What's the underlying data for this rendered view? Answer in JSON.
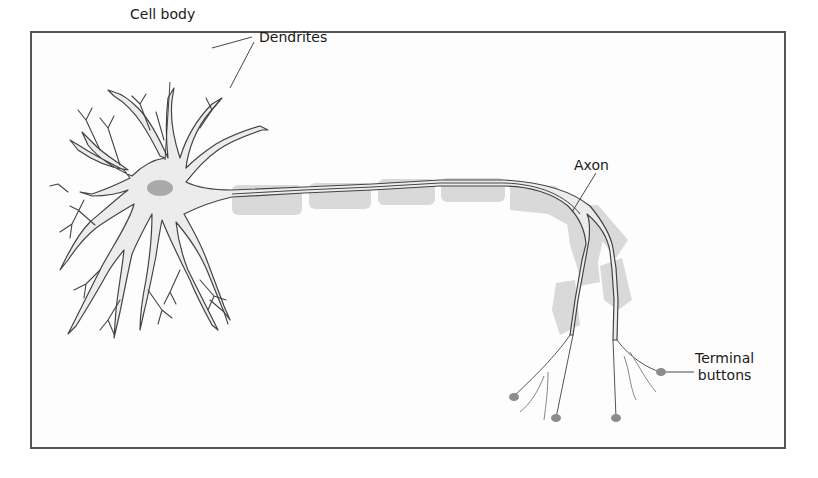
{
  "figure": {
    "labels": {
      "cell_body": "Cell body",
      "dendrites": "Dendrites",
      "axon": "Axon",
      "terminal_buttons_line1": "Terminal",
      "terminal_buttons_line2": "buttons"
    },
    "colors": {
      "frame": "#555555",
      "outline": "#444444",
      "cell_fill": "#ebebeb",
      "nucleus": "#aaaaaa",
      "myelin": "#d6d6d6",
      "terminal": "#8a8a8a"
    }
  }
}
